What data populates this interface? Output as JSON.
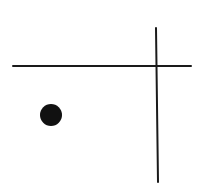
{
  "diagram": {
    "width": 202,
    "height": 190,
    "background": "#ffffff",
    "stroke_color": "#1a1a1a",
    "horizontal_line": {
      "x1": 13,
      "y1": 66,
      "x2": 191,
      "y2": 66,
      "stroke_width": 2
    },
    "vertical_line": {
      "x1": 156,
      "y1": 28,
      "x2": 158,
      "y2": 182,
      "stroke_width": 2
    },
    "dot": {
      "cx": 51,
      "cy": 115,
      "r": 11,
      "fill": "#111111"
    }
  }
}
